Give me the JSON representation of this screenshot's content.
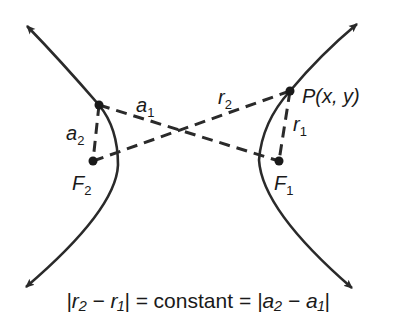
{
  "diagram": {
    "type": "hyperbola",
    "colors": {
      "ink": "#2a2a2a",
      "background": "#ffffff"
    },
    "points": {
      "P": {
        "label": "P(x, y)",
        "x": 290,
        "y": 91
      },
      "F1": {
        "label": "F",
        "sub": "1",
        "x": 279,
        "y": 161
      },
      "F2": {
        "label": "F",
        "sub": "2",
        "x": 93,
        "y": 161
      },
      "V": {
        "x": 99,
        "y": 105
      }
    },
    "segments": {
      "a1": {
        "label": "a",
        "sub": "1"
      },
      "a2": {
        "label": "a",
        "sub": "2"
      },
      "r1": {
        "label": "r",
        "sub": "1"
      },
      "r2": {
        "label": "r",
        "sub": "2"
      }
    },
    "equation": {
      "left": "|r₂ − r₁| = ",
      "middle": "constant",
      "right": " = |a₂ − a₁|"
    }
  }
}
